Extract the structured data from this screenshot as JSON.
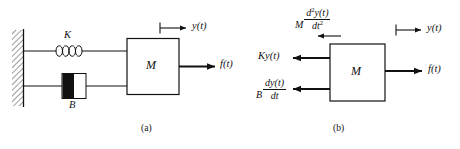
{
  "figure": {
    "background_color": "#ffffff",
    "line_color": "#111111",
    "panels": [
      {
        "key": "a",
        "caption": "(a)",
        "description": "physical schematic"
      },
      {
        "key": "b",
        "caption": "(b)",
        "description": "free-body diagram"
      }
    ]
  },
  "panel_a": {
    "caption": "(a)",
    "wall": {
      "name": "fixed-wall",
      "hatch": "diagonal"
    },
    "spring": {
      "label": "K",
      "coils": 4
    },
    "damper": {
      "label": "B",
      "fill": "#111111"
    },
    "mass": {
      "label": "M"
    },
    "displacement": {
      "label": "y(t)",
      "direction": "right"
    },
    "force": {
      "label": "f(t)",
      "direction": "right"
    }
  },
  "panel_b": {
    "caption": "(b)",
    "mass": {
      "label": "M"
    },
    "inertial_force": {
      "coefficient": "M",
      "numerator_d": "d",
      "numerator_exp": "2",
      "numerator_var": "y(t)",
      "denominator_d": "dt",
      "denominator_exp": "2",
      "plain": "M d²y(t)/dt²",
      "direction": "left"
    },
    "spring_force": {
      "label": "Ky(t)",
      "direction": "left"
    },
    "damping_force": {
      "coefficient": "B",
      "numerator": "dy(t)",
      "denominator": "dt",
      "plain": "B dy(t)/dt",
      "direction": "left"
    },
    "displacement": {
      "label": "y(t)",
      "direction": "right"
    },
    "applied_force": {
      "label": "f(t)",
      "direction": "right"
    }
  }
}
